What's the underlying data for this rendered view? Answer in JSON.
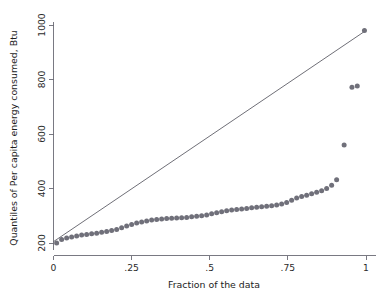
{
  "chart_data": {
    "type": "scatter",
    "title": "",
    "subtitle": "",
    "xlabel": "Fraction of the data",
    "ylabel": "Quantiles of Per capita energy consumed, Btu",
    "xlim": [
      0,
      1
    ],
    "ylim": [
      200,
      1000
    ],
    "xticks": [
      0,
      0.25,
      0.5,
      0.75,
      1
    ],
    "xticklabels": [
      "0",
      ".25",
      ".5",
      ".75",
      "1"
    ],
    "yticks": [
      200,
      400,
      600,
      800,
      1000
    ],
    "yticklabels": [
      "200",
      "400",
      "600",
      "800",
      "1000"
    ],
    "grid": false,
    "legend": null,
    "marker_color": "#70707a",
    "marker_shape": "circle",
    "reference_line": {
      "name": "diagonal reference line",
      "color": "#55555f",
      "x": [
        0.0,
        1.0
      ],
      "y": [
        205,
        980
      ]
    },
    "series": [
      {
        "name": "Quantiles of Per capita energy consumed, Btu",
        "x": [
          0.01,
          0.026,
          0.042,
          0.058,
          0.074,
          0.09,
          0.106,
          0.122,
          0.138,
          0.154,
          0.17,
          0.186,
          0.202,
          0.218,
          0.234,
          0.25,
          0.266,
          0.282,
          0.298,
          0.314,
          0.33,
          0.346,
          0.362,
          0.378,
          0.394,
          0.41,
          0.426,
          0.442,
          0.458,
          0.474,
          0.49,
          0.506,
          0.522,
          0.538,
          0.554,
          0.57,
          0.586,
          0.602,
          0.618,
          0.634,
          0.65,
          0.666,
          0.682,
          0.698,
          0.714,
          0.73,
          0.746,
          0.762,
          0.778,
          0.794,
          0.81,
          0.826,
          0.842,
          0.858,
          0.874,
          0.89,
          0.906,
          0.93,
          0.955,
          0.972,
          0.995
        ],
        "y": [
          200,
          213,
          218,
          222,
          226,
          229,
          231,
          234,
          236,
          239,
          242,
          246,
          250,
          256,
          262,
          268,
          273,
          277,
          281,
          284,
          286,
          288,
          290,
          291,
          292,
          293,
          294,
          296,
          298,
          300,
          303,
          307,
          311,
          315,
          318,
          321,
          323,
          325,
          327,
          329,
          331,
          333,
          335,
          337,
          339,
          343,
          349,
          357,
          365,
          371,
          375,
          381,
          386,
          392,
          400,
          412,
          432,
          560,
          772,
          776,
          980
        ]
      }
    ]
  }
}
